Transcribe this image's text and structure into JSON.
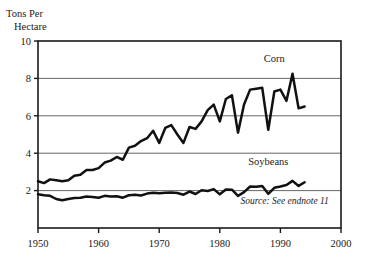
{
  "chart_data": {
    "type": "line",
    "title": "",
    "ylabel": "Tons Per Hectare",
    "ylabel_line1": "Tons Per",
    "ylabel_line2": "Hectare",
    "xlabel": "",
    "xlim": [
      1950,
      2000
    ],
    "ylim": [
      0,
      10
    ],
    "yticks": [
      2,
      4,
      6,
      8,
      10
    ],
    "ytick_labels": [
      "2",
      "4",
      "6",
      "8",
      "10"
    ],
    "xticks": [
      1950,
      1960,
      1970,
      1980,
      1990,
      2000
    ],
    "xtick_labels": [
      "1950",
      "1960",
      "1970",
      "1980",
      "1990",
      "2000"
    ],
    "grid": "horizontal",
    "legend_position": "inline-annotations",
    "annotations": [
      {
        "name": "corn-label",
        "text": "Corn",
        "x": 1989,
        "y": 8.9
      },
      {
        "name": "soybeans-label",
        "text": "Soybeans",
        "x": 1988,
        "y": 3.35
      },
      {
        "name": "source-note",
        "text": "Source: See endnote 11",
        "x": 1998,
        "y": 1.3
      }
    ],
    "series": [
      {
        "name": "Corn",
        "color": "#111111",
        "x": [
          1950,
          1951,
          1952,
          1953,
          1954,
          1955,
          1956,
          1957,
          1958,
          1959,
          1960,
          1961,
          1962,
          1963,
          1964,
          1965,
          1966,
          1967,
          1968,
          1969,
          1970,
          1971,
          1972,
          1973,
          1974,
          1975,
          1976,
          1977,
          1978,
          1979,
          1980,
          1981,
          1982,
          1983,
          1984,
          1985,
          1986,
          1987,
          1988,
          1989,
          1990,
          1991,
          1992,
          1993,
          1994
        ],
        "values": [
          2.5,
          2.4,
          2.6,
          2.55,
          2.5,
          2.55,
          2.8,
          2.85,
          3.1,
          3.1,
          3.2,
          3.5,
          3.6,
          3.8,
          3.65,
          4.3,
          4.4,
          4.65,
          4.8,
          5.2,
          4.55,
          5.35,
          5.5,
          5.0,
          4.55,
          5.4,
          5.3,
          5.7,
          6.3,
          6.6,
          5.7,
          6.9,
          7.1,
          5.1,
          6.6,
          7.4,
          7.45,
          7.5,
          5.25,
          7.3,
          7.4,
          6.8,
          8.25,
          6.4,
          6.5
        ]
      },
      {
        "name": "Soybeans",
        "color": "#111111",
        "x": [
          1950,
          1951,
          1952,
          1953,
          1954,
          1955,
          1956,
          1957,
          1958,
          1959,
          1960,
          1961,
          1962,
          1963,
          1964,
          1965,
          1966,
          1967,
          1968,
          1969,
          1970,
          1971,
          1972,
          1973,
          1974,
          1975,
          1976,
          1977,
          1978,
          1979,
          1980,
          1981,
          1982,
          1983,
          1984,
          1985,
          1986,
          1987,
          1988,
          1989,
          1990,
          1991,
          1992,
          1993,
          1994
        ],
        "values": [
          1.8,
          1.75,
          1.72,
          1.55,
          1.48,
          1.55,
          1.6,
          1.62,
          1.68,
          1.66,
          1.62,
          1.72,
          1.68,
          1.7,
          1.62,
          1.75,
          1.78,
          1.74,
          1.84,
          1.88,
          1.86,
          1.88,
          1.9,
          1.87,
          1.78,
          1.95,
          1.82,
          2.02,
          1.98,
          2.08,
          1.8,
          2.06,
          2.05,
          1.72,
          1.92,
          2.22,
          2.2,
          2.25,
          1.83,
          2.15,
          2.22,
          2.3,
          2.52,
          2.25,
          2.45
        ]
      }
    ]
  }
}
